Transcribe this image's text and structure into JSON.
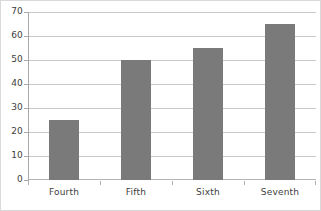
{
  "chart_data": {
    "type": "bar",
    "title": "",
    "subtitle": "",
    "xlabel": "",
    "ylabel": "",
    "categories": [
      "Fourth",
      "Fifth",
      "Sixth",
      "Seventh"
    ],
    "values": [
      25,
      50,
      55,
      65
    ],
    "series": [
      {
        "name": "",
        "values": [
          25,
          50,
          55,
          65
        ]
      }
    ],
    "ylim": [
      0,
      70
    ],
    "y_ticks": [
      0,
      10,
      20,
      30,
      40,
      50,
      60,
      70
    ],
    "y_tick_labels": [
      "0",
      "10",
      "20",
      "30",
      "40",
      "50",
      "60",
      "70"
    ],
    "grid": true,
    "grid_axis": "y",
    "legend": false,
    "legend_position": "none",
    "annotations": [],
    "colors": {
      "bar_fill": "#7a7a7a",
      "gridline": "#c9c9c9",
      "axis_line": "#a8a8a8",
      "frame_border": "#d9d9d9",
      "plot_background": "#ffffff",
      "tick_label": "#404040"
    }
  }
}
